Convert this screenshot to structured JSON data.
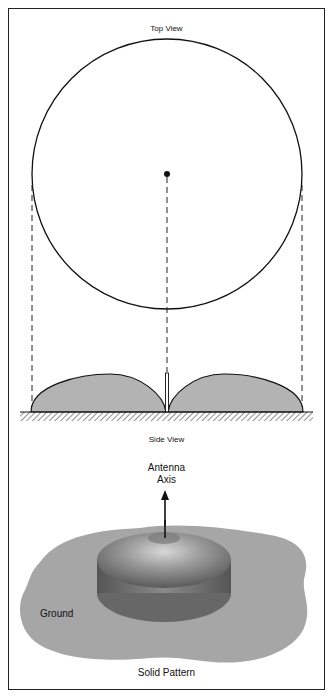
{
  "diagram": {
    "top_view": {
      "title": "Top View"
    },
    "side_view": {
      "title": "Side View"
    },
    "solid_pattern": {
      "axis_label_line1": "Antenna",
      "axis_label_line2": "Axis",
      "ground_label": "Ground",
      "caption": "Solid Pattern"
    },
    "colors": {
      "lobe_fill": "#b3b3b3",
      "ground_fill": "#a6a6a6",
      "torus_dark": "#6e6e6e",
      "torus_light": "#c8c8c8",
      "stroke": "#111111"
    }
  }
}
